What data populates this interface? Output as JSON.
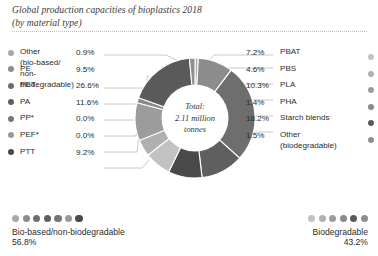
{
  "title": {
    "line1": "Global production capacities of bioplastics 2018",
    "line2": "(by material type)"
  },
  "center": {
    "line1": "Total:",
    "line2": "2.11 million",
    "line3": "tonnes"
  },
  "legend_left": [
    {
      "label": "Other\n(bio-based/\nnon-biodegradable)",
      "pct": "0.9%",
      "color": "#a9a9a9"
    },
    {
      "label": "PE",
      "pct": "9.5%",
      "color": "#8c8c8c"
    },
    {
      "label": "PET",
      "pct": "26.6%",
      "color": "#6e6e6e"
    },
    {
      "label": "PA",
      "pct": "11.6%",
      "color": "#5f5f5f"
    },
    {
      "label": "PP*",
      "pct": "0.0%",
      "color": "#767676"
    },
    {
      "label": "PEF*",
      "pct": "0.0%",
      "color": "#9a9a9a"
    },
    {
      "label": "PTT",
      "pct": "9.2%",
      "color": "#4a4a4a"
    }
  ],
  "legend_right": [
    {
      "label": "PBAT",
      "pct": "7.2%",
      "color": "#c2c2c2"
    },
    {
      "label": "PBS",
      "pct": "4.6%",
      "color": "#b0b0b0"
    },
    {
      "label": "PLA",
      "pct": "10.3%",
      "color": "#9c9c9c"
    },
    {
      "label": "PHA",
      "pct": "1.4%",
      "color": "#8a8a8a"
    },
    {
      "label": "Starch blends",
      "pct": "18.2%",
      "color": "#5a5a5a"
    },
    {
      "label": "Other\n(biodegradable)",
      "pct": "1.5%",
      "color": "#8f8f8f"
    }
  ],
  "summary": {
    "left": {
      "label": "Bio-based/non-biodegradable",
      "pct": "56.8%"
    },
    "right": {
      "label": "Biodegradable",
      "pct": "43.2%"
    }
  },
  "chart_data": {
    "type": "pie",
    "title": "Global production capacities of bioplastics 2018 (by material type)",
    "subtitle": "(by material type)",
    "center_label": "Total: 2.11 million tonnes",
    "total": 2.11,
    "total_unit": "million tonnes",
    "donut": true,
    "inner_radius_ratio": 0.55,
    "legend_position": "left-and-right",
    "grid": false,
    "labels": [
      "Other (bio-based/non-biodegradable)",
      "PE",
      "PET",
      "PA",
      "PP*",
      "PEF*",
      "PTT",
      "PBAT",
      "PBS",
      "PLA",
      "PHA",
      "Starch blends",
      "Other (biodegradable)"
    ],
    "values": [
      0.9,
      9.5,
      26.6,
      11.6,
      0.0,
      0.0,
      9.2,
      7.2,
      4.6,
      10.3,
      1.4,
      18.2,
      1.5
    ],
    "colors": [
      "#a9a9a9",
      "#8c8c8c",
      "#6e6e6e",
      "#5f5f5f",
      "#767676",
      "#9a9a9a",
      "#4a4a4a",
      "#c2c2c2",
      "#b0b0b0",
      "#9c9c9c",
      "#8a8a8a",
      "#5a5a5a",
      "#8f8f8f"
    ],
    "groups": [
      {
        "name": "Bio-based/non-biodegradable",
        "pct": 56.8,
        "members": [
          "Other (bio-based/non-biodegradable)",
          "PE",
          "PET",
          "PA",
          "PP*",
          "PEF*",
          "PTT"
        ]
      },
      {
        "name": "Biodegradable",
        "pct": 43.2,
        "members": [
          "PBAT",
          "PBS",
          "PLA",
          "PHA",
          "Starch blends",
          "Other (biodegradable)"
        ]
      }
    ],
    "units": "% of total production capacity"
  }
}
